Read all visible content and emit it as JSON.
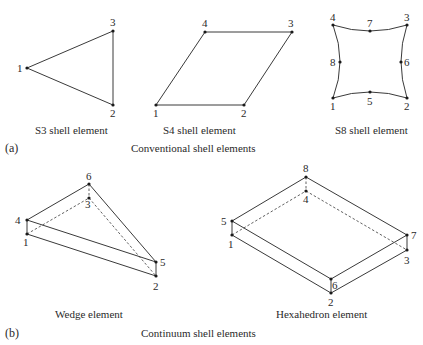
{
  "figure": {
    "panel_a": {
      "label": "(a)",
      "title": "Conventional shell elements",
      "elements": [
        {
          "name": "S3 shell element",
          "nodes": [
            {
              "id": "1",
              "x": 27,
              "y": 68
            },
            {
              "id": "2",
              "x": 113,
              "y": 105
            },
            {
              "id": "3",
              "x": 113,
              "y": 31
            }
          ]
        },
        {
          "name": "S4 shell element",
          "nodes": [
            {
              "id": "1",
              "x": 156,
              "y": 105
            },
            {
              "id": "2",
              "x": 244,
              "y": 105
            },
            {
              "id": "3",
              "x": 292,
              "y": 32
            },
            {
              "id": "4",
              "x": 205,
              "y": 32
            }
          ]
        },
        {
          "name": "S8 shell element",
          "nodes": [
            {
              "id": "1",
              "x": 333,
              "y": 98
            },
            {
              "id": "2",
              "x": 407,
              "y": 98
            },
            {
              "id": "3",
              "x": 407,
              "y": 25
            },
            {
              "id": "4",
              "x": 333,
              "y": 25
            },
            {
              "id": "5",
              "x": 370,
              "y": 92
            },
            {
              "id": "6",
              "x": 401,
              "y": 62
            },
            {
              "id": "7",
              "x": 370,
              "y": 31
            },
            {
              "id": "8",
              "x": 340,
              "y": 62
            }
          ]
        }
      ]
    },
    "panel_b": {
      "label": "(b)",
      "title": "Continuum shell elements",
      "elements": [
        {
          "name": "Wedge element",
          "nodes": [
            {
              "id": "1",
              "x": 27,
              "y": 234
            },
            {
              "id": "2",
              "x": 156,
              "y": 276
            },
            {
              "id": "3",
              "x": 89,
              "y": 198
            },
            {
              "id": "4",
              "x": 27,
              "y": 220
            },
            {
              "id": "5",
              "x": 156,
              "y": 262
            },
            {
              "id": "6",
              "x": 89,
              "y": 184
            }
          ]
        },
        {
          "name": "Hexahedron element",
          "nodes": [
            {
              "id": "1",
              "x": 232,
              "y": 235
            },
            {
              "id": "2",
              "x": 331,
              "y": 293
            },
            {
              "id": "3",
              "x": 407,
              "y": 250
            },
            {
              "id": "4",
              "x": 306,
              "y": 191
            },
            {
              "id": "5",
              "x": 232,
              "y": 221
            },
            {
              "id": "6",
              "x": 331,
              "y": 279
            },
            {
              "id": "7",
              "x": 407,
              "y": 235
            },
            {
              "id": "8",
              "x": 306,
              "y": 177
            }
          ]
        }
      ]
    }
  }
}
